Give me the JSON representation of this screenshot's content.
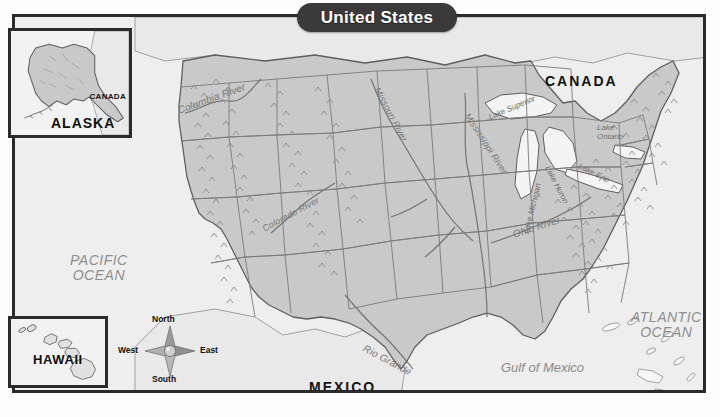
{
  "title": {
    "text": "United States"
  },
  "countries": [
    {
      "name": "CANADA",
      "label": "CANADA"
    },
    {
      "name": "MEXICO",
      "label": "MEXICO"
    }
  ],
  "oceans": [
    {
      "name": "pacific",
      "line1": "PACIFIC",
      "line2": "OCEAN"
    },
    {
      "name": "atlantic",
      "line1": "ATLANTIC",
      "line2": "OCEAN"
    }
  ],
  "water_bodies": [
    {
      "name": "gulf-of-mexico",
      "label": "Gulf of Mexico"
    }
  ],
  "rivers": [
    {
      "name": "columbia-river",
      "label": "Columbia River"
    },
    {
      "name": "missouri-river",
      "label": "Missouri River"
    },
    {
      "name": "mississippi-river",
      "label": "Mississippi River"
    },
    {
      "name": "colorado-river",
      "label": "Colorado River"
    },
    {
      "name": "rio-grande",
      "label": "Rio Grande"
    },
    {
      "name": "ohio-river",
      "label": "Ohio River"
    }
  ],
  "lakes": [
    {
      "name": "lake-superior",
      "label": "Lake Superior"
    },
    {
      "name": "lake-michigan",
      "label": "Lake Michigan"
    },
    {
      "name": "lake-huron",
      "label": "Lake Huron"
    },
    {
      "name": "lake-erie",
      "label": "Lake Erie"
    },
    {
      "name": "lake-ontario",
      "line1": "Lake",
      "line2": "Ontario"
    }
  ],
  "insets": {
    "alaska": {
      "label": "ALASKA",
      "neighbor_label": "CANADA"
    },
    "hawaii": {
      "label": "HAWAII"
    }
  },
  "compass": {
    "north": "North",
    "south": "South",
    "east": "East",
    "west": "West"
  },
  "colors": {
    "frame": "#2b2b2b",
    "title_pill": "#3a3a3a",
    "title_text": "#ffffff",
    "land_us": "#c9c9c9",
    "land_other": "#e9e9e9",
    "ocean": "#eeeeee",
    "border_line": "#6e6e6e",
    "label_dark": "#111111",
    "label_gray": "#8f8f8f"
  }
}
